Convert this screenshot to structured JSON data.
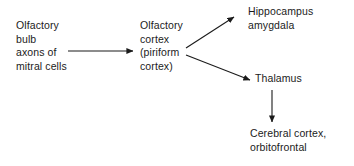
{
  "diagram": {
    "background_color": "#ffffff",
    "text_color": "#1b1b1b",
    "line_color": "#1b1b1b",
    "nodes": [
      {
        "id": "olfactory-bulb",
        "label": "Olfactory\nbulb\naxons of\nmitral cells"
      },
      {
        "id": "olfactory-cortex",
        "label": "Olfactory\ncortex\n(piriform\ncortex)"
      },
      {
        "id": "hippocampus-amygdala",
        "label": "Hippocampus\namygdala"
      },
      {
        "id": "thalamus",
        "label": "Thalamus"
      },
      {
        "id": "cerebral-cortex-orbitofrontal",
        "label": "Cerebral cortex,\norbitofrontal"
      }
    ],
    "arrows": [
      {
        "id": "bulb-to-cortex",
        "from": "olfactory-bulb",
        "to": "olfactory-cortex",
        "direction": "right"
      },
      {
        "id": "cortex-to-hippocampus",
        "from": "olfactory-cortex",
        "to": "hippocampus-amygdala",
        "direction": "up-right"
      },
      {
        "id": "cortex-to-thalamus",
        "from": "olfactory-cortex",
        "to": "thalamus",
        "direction": "down-right"
      },
      {
        "id": "thalamus-to-cerebral-cortex",
        "from": "thalamus",
        "to": "cerebral-cortex-orbitofrontal",
        "direction": "down"
      }
    ]
  }
}
